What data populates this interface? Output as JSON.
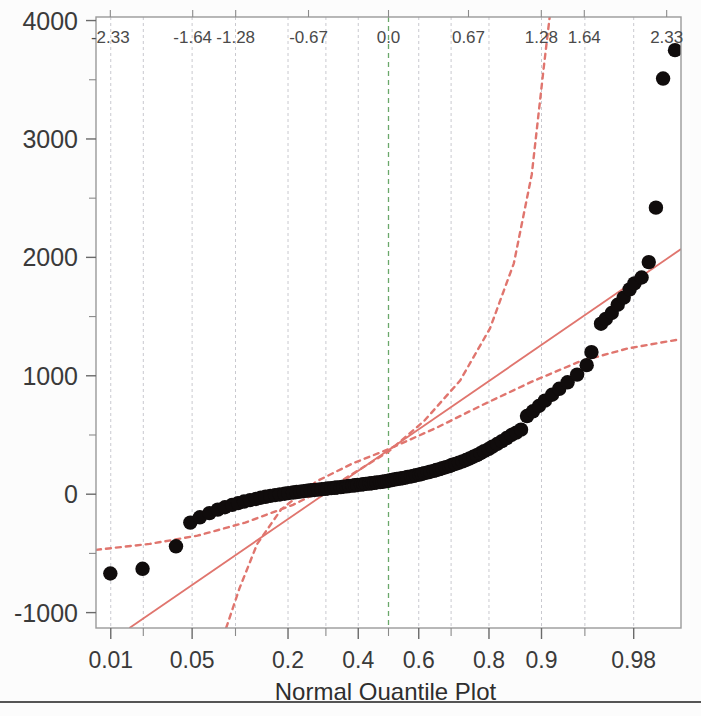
{
  "chart_data": {
    "type": "scatter",
    "title": "",
    "caption": "Normal Quantile Plot",
    "xlabel": "Normal Quantile Plot",
    "ylabel": "",
    "x_axis": {
      "name": "probability",
      "tick_labels": [
        "0.01",
        "0.05",
        "0.2",
        "0.4",
        "0.6",
        "0.8",
        "0.9",
        "0.98"
      ],
      "tick_values": [
        0.01,
        0.05,
        0.2,
        0.4,
        0.6,
        0.8,
        0.9,
        0.98
      ],
      "minor_tick_values": [
        0.02,
        0.1,
        0.3,
        0.5,
        0.7,
        0.95
      ],
      "scale": "normal-probability",
      "range_z": [
        -2.45,
        2.45
      ]
    },
    "top_axis": {
      "name": "normal quantile (z)",
      "tick_labels": [
        "-2.33",
        "-1.64",
        "-1.28",
        "-0.67",
        "0.0",
        "0.67",
        "1.28",
        "1.64",
        "2.33"
      ],
      "tick_values": [
        -2.33,
        -1.64,
        -1.28,
        -0.67,
        0.0,
        0.67,
        1.28,
        1.64,
        2.33
      ]
    },
    "y_axis": {
      "tick_labels": [
        "4000",
        "3000",
        "2000",
        "1000",
        "0",
        "-1000"
      ],
      "tick_values": [
        4000,
        3000,
        2000,
        1000,
        0,
        -1000
      ],
      "ylim": [
        -1130,
        4030
      ],
      "minor_ticks": [
        3500,
        2500,
        1500,
        500,
        -500
      ]
    },
    "grid": "vertical dashed gridlines; green dashed line at z=0 (p=0.5)",
    "legend": "none",
    "reference_line": {
      "style": "solid",
      "color": "#e0756e",
      "description": "normal fit line",
      "points_z_y": [
        [
          -2.17,
          -1130
        ],
        [
          2.45,
          2070
        ]
      ]
    },
    "confidence_bands": {
      "style": "dashed",
      "color": "#e0756e",
      "description": "95% confidence bounds about the normal fit",
      "upper_z_y": [
        [
          -2.45,
          -470
        ],
        [
          -2.0,
          -420
        ],
        [
          -1.6,
          -350
        ],
        [
          -1.2,
          -240
        ],
        [
          -0.8,
          -90
        ],
        [
          -0.4,
          110
        ],
        [
          0.0,
          360
        ],
        [
          0.3,
          620
        ],
        [
          0.6,
          960
        ],
        [
          0.85,
          1400
        ],
        [
          1.05,
          1950
        ],
        [
          1.2,
          2700
        ],
        [
          1.3,
          3600
        ],
        [
          1.35,
          4030
        ]
      ],
      "lower_z_y": [
        [
          -1.36,
          -1130
        ],
        [
          -1.25,
          -800
        ],
        [
          -1.1,
          -420
        ],
        [
          -0.9,
          -130
        ],
        [
          -0.6,
          110
        ],
        [
          -0.3,
          260
        ],
        [
          0.0,
          380
        ],
        [
          0.4,
          560
        ],
        [
          0.8,
          760
        ],
        [
          1.2,
          950
        ],
        [
          1.6,
          1120
        ],
        [
          2.0,
          1230
        ],
        [
          2.45,
          1310
        ]
      ]
    },
    "series": [
      {
        "name": "sample quantiles",
        "n_points": 118,
        "points_z_y": [
          [
            -2.33,
            -670
          ],
          [
            -2.06,
            -630
          ],
          [
            -1.78,
            -440
          ],
          [
            -1.66,
            -240
          ],
          [
            -1.58,
            -195
          ],
          [
            -1.5,
            -160
          ],
          [
            -1.43,
            -130
          ],
          [
            -1.37,
            -110
          ],
          [
            -1.31,
            -90
          ],
          [
            -1.26,
            -75
          ],
          [
            -1.21,
            -62
          ],
          [
            -1.16,
            -50
          ],
          [
            -1.11,
            -40
          ],
          [
            -1.07,
            -30
          ],
          [
            -1.03,
            -22
          ],
          [
            -0.99,
            -14
          ],
          [
            -0.95,
            -8
          ],
          [
            -0.91,
            -2
          ],
          [
            -0.87,
            4
          ],
          [
            -0.84,
            9
          ],
          [
            -0.8,
            14
          ],
          [
            -0.77,
            18
          ],
          [
            -0.74,
            22
          ],
          [
            -0.71,
            26
          ],
          [
            -0.68,
            30
          ],
          [
            -0.65,
            33
          ],
          [
            -0.62,
            36
          ],
          [
            -0.59,
            39
          ],
          [
            -0.56,
            42
          ],
          [
            -0.53,
            45
          ],
          [
            -0.51,
            48
          ],
          [
            -0.48,
            51
          ],
          [
            -0.45,
            54
          ],
          [
            -0.43,
            57
          ],
          [
            -0.4,
            60
          ],
          [
            -0.38,
            63
          ],
          [
            -0.35,
            66
          ],
          [
            -0.33,
            69
          ],
          [
            -0.3,
            72
          ],
          [
            -0.28,
            75
          ],
          [
            -0.26,
            78
          ],
          [
            -0.23,
            81
          ],
          [
            -0.21,
            84
          ],
          [
            -0.19,
            87
          ],
          [
            -0.16,
            90
          ],
          [
            -0.14,
            93
          ],
          [
            -0.12,
            96
          ],
          [
            -0.1,
            99
          ],
          [
            -0.07,
            102
          ],
          [
            -0.05,
            105
          ],
          [
            -0.03,
            108
          ],
          [
            -0.01,
            112
          ],
          [
            0.01,
            116
          ],
          [
            0.03,
            120
          ],
          [
            0.05,
            124
          ],
          [
            0.07,
            128
          ],
          [
            0.1,
            132
          ],
          [
            0.12,
            136
          ],
          [
            0.14,
            140
          ],
          [
            0.16,
            145
          ],
          [
            0.19,
            150
          ],
          [
            0.21,
            155
          ],
          [
            0.23,
            160
          ],
          [
            0.26,
            166
          ],
          [
            0.28,
            172
          ],
          [
            0.3,
            178
          ],
          [
            0.33,
            184
          ],
          [
            0.35,
            190
          ],
          [
            0.38,
            197
          ],
          [
            0.4,
            204
          ],
          [
            0.43,
            212
          ],
          [
            0.45,
            220
          ],
          [
            0.48,
            228
          ],
          [
            0.51,
            237
          ],
          [
            0.53,
            246
          ],
          [
            0.56,
            256
          ],
          [
            0.59,
            266
          ],
          [
            0.62,
            277
          ],
          [
            0.65,
            289
          ],
          [
            0.68,
            302
          ],
          [
            0.71,
            316
          ],
          [
            0.74,
            330
          ],
          [
            0.77,
            346
          ],
          [
            0.8,
            363
          ],
          [
            0.84,
            382
          ],
          [
            0.87,
            402
          ],
          [
            0.91,
            424
          ],
          [
            0.95,
            448
          ],
          [
            0.99,
            474
          ],
          [
            1.03,
            500
          ],
          [
            1.07,
            520
          ],
          [
            1.11,
            545
          ],
          [
            1.16,
            660
          ],
          [
            1.21,
            700
          ],
          [
            1.26,
            745
          ],
          [
            1.31,
            790
          ],
          [
            1.37,
            840
          ],
          [
            1.43,
            890
          ],
          [
            1.5,
            945
          ],
          [
            1.58,
            1010
          ],
          [
            1.66,
            1090
          ],
          [
            1.7,
            1200
          ],
          [
            1.78,
            1440
          ],
          [
            1.82,
            1480
          ],
          [
            1.87,
            1530
          ],
          [
            1.92,
            1600
          ],
          [
            1.97,
            1660
          ],
          [
            2.02,
            1730
          ],
          [
            2.06,
            1780
          ],
          [
            2.12,
            1830
          ],
          [
            2.18,
            1960
          ],
          [
            2.24,
            2420
          ],
          [
            2.3,
            3510
          ],
          [
            2.4,
            3750
          ]
        ]
      }
    ]
  },
  "footer": {
    "divider": true
  }
}
